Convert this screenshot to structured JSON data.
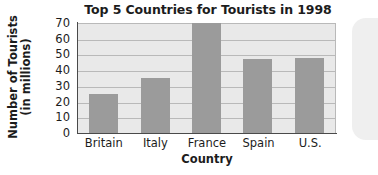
{
  "chart_data": {
    "type": "bar",
    "title": "Top 5 Countries for Tourists in 1998",
    "xlabel": "Country",
    "ylabel_line1": "Number of Tourists",
    "ylabel_line2": "(in millions)",
    "ylabel": "Number of Tourists (in millions)",
    "categories": [
      "Britain",
      "Italy",
      "France",
      "Spain",
      "U.S."
    ],
    "values": [
      25,
      35,
      70,
      47,
      48
    ],
    "ylim": [
      0,
      70
    ],
    "yticks": [
      70,
      60,
      50,
      40,
      30,
      20,
      10,
      0
    ],
    "ytick_labels": [
      "70",
      "60",
      "50",
      "40",
      "30",
      "20",
      "10",
      "0"
    ],
    "grid": true,
    "grid_axis": "y",
    "legend": false,
    "bar_color": "#9b9b9b",
    "plot_background": "#e9e9e9",
    "gridline_color": "#b9b9b9",
    "axis_color": "#4a4a4a",
    "text_color": "#1c1c1c"
  }
}
